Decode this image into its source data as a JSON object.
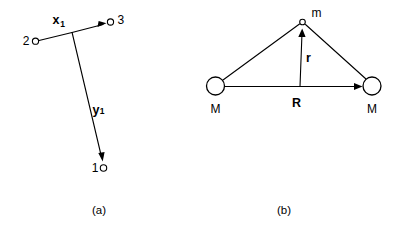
{
  "figure": {
    "background_color": "#ffffff",
    "ink_color": "#000000",
    "panels": [
      {
        "id": "panel-a",
        "caption": "(a)",
        "description": "Local element coordinate axes at a beam-column joint",
        "nodes": [
          {
            "id": "node-2",
            "label": "2",
            "marker": "open-circle-small"
          },
          {
            "id": "node-3",
            "label": "3",
            "marker": "open-circle-small"
          },
          {
            "id": "node-1",
            "label": "1",
            "marker": "open-circle-small"
          }
        ],
        "vectors": [
          {
            "id": "vector-x1",
            "symbol": "x",
            "subscript": "1",
            "points_to": "node-3"
          },
          {
            "id": "vector-y1",
            "symbol": "y",
            "subscript": "1",
            "points_to": "node-1"
          }
        ]
      },
      {
        "id": "panel-b",
        "caption": "(b)",
        "description": "Two masses M and a small mass m with position vectors R and r",
        "nodes": [
          {
            "id": "mass-left",
            "label": "M",
            "marker": "open-circle-large"
          },
          {
            "id": "mass-right",
            "label": "M",
            "marker": "open-circle-large"
          },
          {
            "id": "mass-m",
            "label": "m",
            "marker": "open-circle-small"
          }
        ],
        "vectors": [
          {
            "id": "vector-R",
            "symbol": "R",
            "points_to": "mass-right"
          },
          {
            "id": "vector-r",
            "symbol": "r",
            "points_to": "mass-m"
          }
        ]
      }
    ]
  }
}
